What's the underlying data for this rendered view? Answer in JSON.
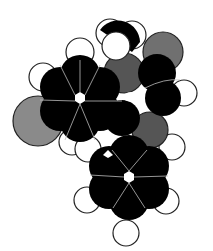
{
  "diagram": {
    "type": "space-filling molecular model",
    "colors": {
      "carbon": "#000000",
      "hydrogen": "#ffffff",
      "heteroatom": "#808080",
      "heteroatom_dark": "#555555",
      "outline": "#222222",
      "bond_line": "#bbbbbb"
    },
    "rings": [
      {
        "name": "upper-left-benzene-ring",
        "center": [
          80,
          98
        ]
      },
      {
        "name": "lower-benzene-ring",
        "center": [
          129,
          177
        ]
      }
    ]
  }
}
